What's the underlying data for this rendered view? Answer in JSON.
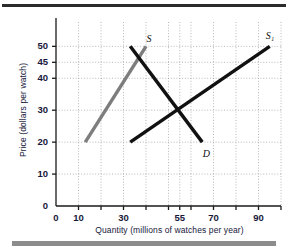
{
  "figure": {
    "background_color": "#ffffff",
    "top_rule_color": "#2b2b2b",
    "bottom_rule_color": "#8c8c8c"
  },
  "chart_data": {
    "type": "line",
    "title": "",
    "xlabel": "Quantity (millions of watches per year)",
    "ylabel": "Price (dollars per watch)",
    "xlim": [
      0,
      100
    ],
    "ylim": [
      0,
      57
    ],
    "grid": true,
    "grid_style": "dotted",
    "legend_position": "inline-labels",
    "xticks": [
      0,
      10,
      30,
      55,
      70,
      90
    ],
    "xtick_labels": [
      "0",
      "10",
      "30",
      "55",
      "70",
      "90"
    ],
    "xminor_ticks": [
      20,
      40,
      50,
      60,
      80,
      100
    ],
    "yticks": [
      0,
      10,
      20,
      30,
      40,
      45,
      50
    ],
    "ytick_labels": [
      "0",
      "10",
      "20",
      "30",
      "40",
      "45",
      "50"
    ],
    "equilibrium": {
      "quantity": 55,
      "price": 30
    },
    "series": [
      {
        "name": "S",
        "label": "S",
        "role": "supply-original",
        "color": "#7d7d7d",
        "width": 3.4,
        "points": [
          [
            13,
            20
          ],
          [
            40,
            50
          ]
        ]
      },
      {
        "name": "S1",
        "label": "S₁",
        "role": "supply-shifted",
        "color": "#111111",
        "width": 3.4,
        "points": [
          [
            33,
            20
          ],
          [
            95,
            50
          ]
        ]
      },
      {
        "name": "D",
        "label": "D",
        "role": "demand",
        "color": "#111111",
        "width": 3.4,
        "points": [
          [
            33,
            50
          ],
          [
            65,
            20
          ]
        ]
      }
    ],
    "annotations": [
      {
        "text": "S",
        "x": 42,
        "y": 52,
        "style": "italic"
      },
      {
        "text": "S₁",
        "x": 95,
        "y": 53,
        "style": "italic"
      },
      {
        "text": "D",
        "x": 67,
        "y": 16,
        "style": "italic"
      }
    ]
  }
}
